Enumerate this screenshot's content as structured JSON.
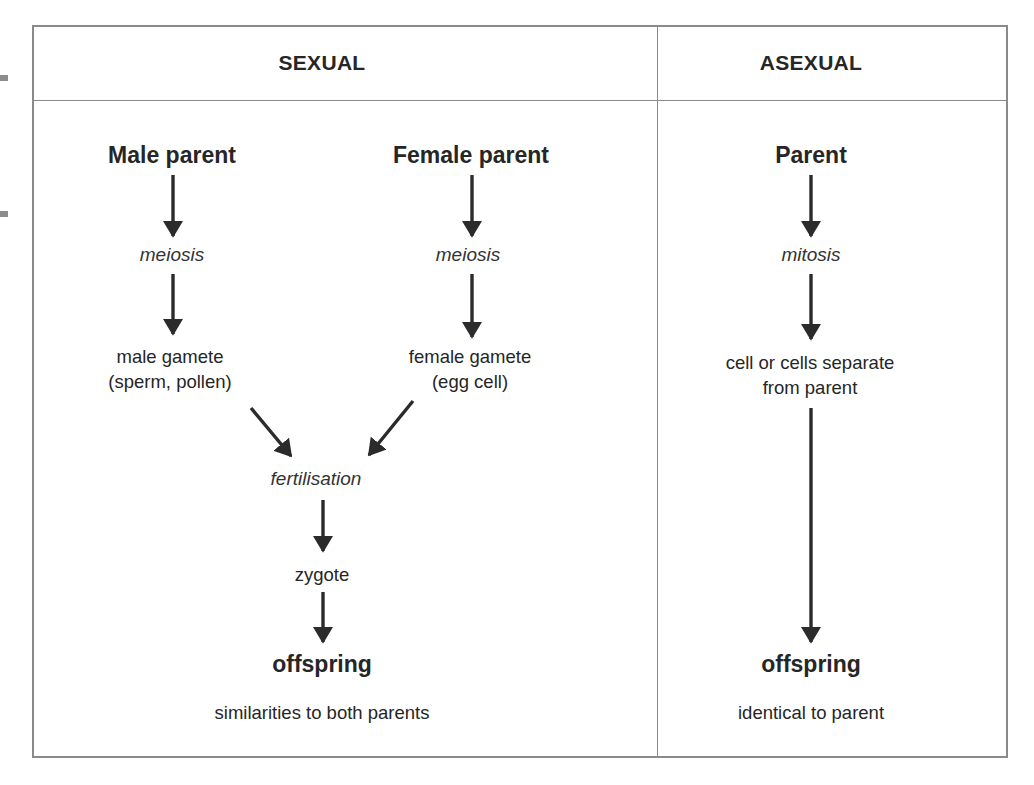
{
  "diagram": {
    "columns": {
      "sexual": {
        "heading": "SEXUAL",
        "male_parent": "Male parent",
        "female_parent": "Female parent",
        "male_process": "meiosis",
        "female_process": "meiosis",
        "male_gamete_line1": "male gamete",
        "male_gamete_line2": "(sperm, pollen)",
        "female_gamete_line1": "female gamete",
        "female_gamete_line2": "(egg cell)",
        "fertilisation": "fertilisation",
        "zygote": "zygote",
        "offspring": "offspring",
        "offspring_note": "similarities to both parents"
      },
      "asexual": {
        "heading": "ASEXUAL",
        "parent": "Parent",
        "process": "mitosis",
        "separation_line1": "cell or cells separate",
        "separation_line2": "from parent",
        "offspring": "offspring",
        "offspring_note": "identical to parent"
      }
    },
    "flows": [
      {
        "from": "Male parent",
        "to": "meiosis"
      },
      {
        "from": "meiosis",
        "to": "male gamete"
      },
      {
        "from": "Female parent",
        "to": "meiosis"
      },
      {
        "from": "meiosis",
        "to": "female gamete"
      },
      {
        "from": "male gamete",
        "to": "fertilisation"
      },
      {
        "from": "female gamete",
        "to": "fertilisation"
      },
      {
        "from": "fertilisation",
        "to": "zygote"
      },
      {
        "from": "zygote",
        "to": "offspring"
      },
      {
        "from": "Parent",
        "to": "mitosis"
      },
      {
        "from": "mitosis",
        "to": "cell or cells separate from parent"
      },
      {
        "from": "cell or cells separate from parent",
        "to": "offspring"
      }
    ],
    "colors": {
      "border": "#8a8a8a",
      "text": "#262626",
      "arrow": "#2b2b2b"
    }
  }
}
